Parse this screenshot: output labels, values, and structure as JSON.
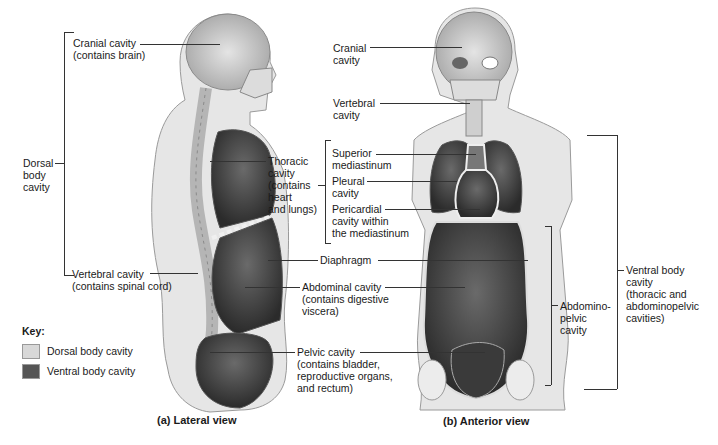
{
  "figure": {
    "panel_a": {
      "caption": "(a) Lateral view",
      "labels": {
        "cranial": "Cranial cavity\n(contains brain)",
        "dorsal": "Dorsal\nbody\ncavity",
        "vertebral": "Vertebral cavity\n(contains spinal cord)",
        "thoracic": "Thoracic\ncavity\n(contains\nheart\nand lungs)",
        "diaphragm": "Diaphragm",
        "abdominal": "Abdominal cavity\n(contains digestive\nviscera)",
        "pelvic": "Pelvic cavity\n(contains bladder,\nreproductive organs,\nand rectum)"
      }
    },
    "panel_b": {
      "caption": "(b) Anterior view",
      "labels": {
        "cranial": "Cranial\ncavity",
        "vertebral": "Vertebral\ncavity",
        "superior_mediastinum": "Superior\nmediastinum",
        "pleural": "Pleural\ncavity",
        "pericardial": "Pericardial\ncavity within\nthe mediastinum",
        "abdominopelvic": "Abdomino-\npelvic\ncavity",
        "ventral": "Ventral body\ncavity\n(thoracic and\nabdominopelvic\ncavities)"
      }
    },
    "key": {
      "title": "Key:",
      "items": [
        {
          "label": "Dorsal body cavity",
          "color": "#d8d8d8"
        },
        {
          "label": "Ventral body cavity",
          "color": "#555555"
        }
      ]
    }
  }
}
